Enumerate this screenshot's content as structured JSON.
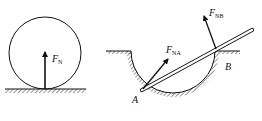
{
  "figure_left": {
    "force_label": "F",
    "force_subscript": "N"
  },
  "figure_right": {
    "force_a_label": "F",
    "force_a_subscript": "NA",
    "force_b_label": "F",
    "force_b_subscript": "NB",
    "point_a": "A",
    "point_b": "B"
  },
  "colors": {
    "stroke": "#111111",
    "background": "#ffffff"
  }
}
